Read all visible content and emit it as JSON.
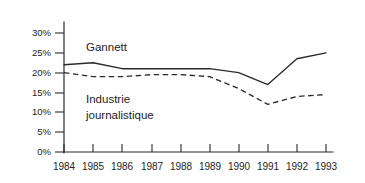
{
  "chart_data": {
    "type": "line",
    "title": "",
    "subtitle": "",
    "xlabel": "",
    "ylabel": "",
    "categories": [
      "1984",
      "1985",
      "1986",
      "1987",
      "1988",
      "1989",
      "1990",
      "1991",
      "1992",
      "1993"
    ],
    "x": [
      1984,
      1985,
      1986,
      1987,
      1988,
      1989,
      1990,
      1991,
      1992,
      1993
    ],
    "series": [
      {
        "name": "Gannett",
        "style": "solid",
        "color": "#2b2b2b",
        "values": [
          22,
          22.5,
          21,
          21,
          21,
          21,
          20,
          17,
          23.5,
          25
        ]
      },
      {
        "name": "Industrie journalistique",
        "style": "dashed",
        "color": "#2b2b2b",
        "values": [
          20,
          19,
          19,
          19.5,
          19.5,
          19,
          16,
          12,
          14,
          14.5
        ]
      }
    ],
    "ylim": [
      0,
      30
    ],
    "ytick_values": [
      0,
      5,
      10,
      15,
      20,
      25,
      30
    ],
    "ytick_labels": [
      "0%",
      "5%",
      "10%",
      "15%",
      "20%",
      "25%",
      "30%"
    ],
    "grid": false,
    "legend": "inline-annotations",
    "annotations": [
      {
        "name": "gannett-label",
        "text": "Gannett"
      },
      {
        "name": "industry-label-line1",
        "text": "Industrie"
      },
      {
        "name": "industry-label-line2",
        "text": "journalistique"
      }
    ]
  },
  "colors": {
    "ink": "#2b2b2b",
    "text": "#232323",
    "background": "#ffffff"
  }
}
